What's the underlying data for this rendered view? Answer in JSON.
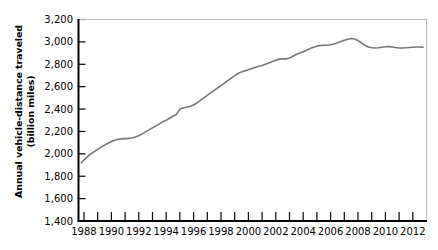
{
  "chart_data": {
    "type": "line",
    "title": "",
    "subtitle": "",
    "xlabel": "",
    "ylabel": "Annual vehicle-distance traveled (billion miles)",
    "ylabel_line1": "Annual vehicle-distance traveled",
    "ylabel_line2": "(billion miles)",
    "xlim": [
      1987.6,
      2013.0
    ],
    "ylim": [
      1400,
      3200
    ],
    "grid": false,
    "legend": null,
    "legend_position": "none",
    "line_color": "#767676",
    "axis_color": "#000000",
    "plot_border_color": "#b0b0b0",
    "background_color": "#ffffff",
    "ytick_labels": [
      "1,400",
      "1,600",
      "1,800",
      "2,000",
      "2,200",
      "2,400",
      "2,600",
      "2,800",
      "3,000",
      "3,200"
    ],
    "ytick_values": [
      1400,
      1600,
      1800,
      2000,
      2200,
      2400,
      2600,
      2800,
      3000,
      3200
    ],
    "xtick_values": [
      1988,
      1989,
      1990,
      1991,
      1992,
      1993,
      1994,
      1995,
      1996,
      1997,
      1998,
      1999,
      2000,
      2001,
      2002,
      2003,
      2004,
      2005,
      2006,
      2007,
      2008,
      2009,
      2010,
      2011,
      2012
    ],
    "xtick_labels_shown": [
      "1988",
      "1990",
      "1992",
      "1994",
      "1996",
      "1998",
      "2000",
      "2002",
      "2004",
      "2006",
      "2008",
      "2010",
      "2012"
    ],
    "series": [
      {
        "name": "Annual vehicle-distance traveled",
        "units": "billion miles",
        "x": [
          1987.8,
          1988.0,
          1988.25,
          1988.5,
          1988.75,
          1989.0,
          1989.25,
          1989.5,
          1989.75,
          1990.0,
          1990.25,
          1990.5,
          1990.75,
          1991.0,
          1991.25,
          1991.5,
          1991.75,
          1992.0,
          1992.25,
          1992.5,
          1992.75,
          1993.0,
          1993.25,
          1993.5,
          1993.75,
          1994.0,
          1994.25,
          1994.5,
          1994.75,
          1995.0,
          1995.25,
          1995.5,
          1995.75,
          1996.0,
          1996.25,
          1996.5,
          1996.75,
          1997.0,
          1997.25,
          1997.5,
          1997.75,
          1998.0,
          1998.25,
          1998.5,
          1998.75,
          1999.0,
          1999.25,
          1999.5,
          1999.75,
          2000.0,
          2000.25,
          2000.5,
          2000.75,
          2001.0,
          2001.25,
          2001.5,
          2001.75,
          2002.0,
          2002.25,
          2002.5,
          2002.75,
          2003.0,
          2003.25,
          2003.5,
          2003.75,
          2004.0,
          2004.25,
          2004.5,
          2004.75,
          2005.0,
          2005.25,
          2005.5,
          2005.75,
          2006.0,
          2006.25,
          2006.5,
          2006.75,
          2007.0,
          2007.25,
          2007.5,
          2007.75,
          2008.0,
          2008.25,
          2008.5,
          2008.75,
          2009.0,
          2009.25,
          2009.5,
          2009.75,
          2010.0,
          2010.25,
          2010.5,
          2010.75,
          2011.0,
          2011.25,
          2011.5,
          2011.75,
          2012.0,
          2012.25,
          2012.5,
          2012.75
        ],
        "y": [
          1920,
          1945,
          1975,
          2000,
          2020,
          2040,
          2060,
          2078,
          2095,
          2110,
          2122,
          2130,
          2134,
          2136,
          2138,
          2142,
          2150,
          2162,
          2178,
          2196,
          2214,
          2232,
          2250,
          2268,
          2286,
          2300,
          2318,
          2336,
          2352,
          2400,
          2410,
          2418,
          2424,
          2436,
          2456,
          2478,
          2500,
          2522,
          2544,
          2566,
          2588,
          2610,
          2632,
          2654,
          2676,
          2698,
          2718,
          2732,
          2742,
          2752,
          2762,
          2772,
          2782,
          2790,
          2800,
          2812,
          2824,
          2836,
          2846,
          2850,
          2848,
          2856,
          2872,
          2888,
          2900,
          2912,
          2926,
          2940,
          2952,
          2962,
          2968,
          2970,
          2970,
          2974,
          2982,
          2992,
          3004,
          3014,
          3024,
          3030,
          3026,
          3012,
          2992,
          2970,
          2955,
          2948,
          2946,
          2948,
          2952,
          2956,
          2958,
          2955,
          2950,
          2946,
          2946,
          2948,
          2950,
          2952,
          2954,
          2954,
          2952
        ]
      }
    ],
    "annotations": {
      "start_value": 1920,
      "start_year": 1988,
      "peak_value": 3030,
      "peak_year": 2007,
      "end_value": 2952,
      "end_year": 2012
    }
  },
  "axes": {
    "y_axis_name": "y-axis",
    "x_axis_name": "x-axis"
  }
}
